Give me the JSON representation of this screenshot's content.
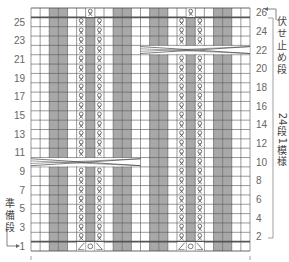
{
  "chart_data": {
    "type": "knitting-chart",
    "title": "",
    "columns": 24,
    "rows": 26,
    "colors": {
      "background": "#ffffff",
      "purl_column": "#a8a8a8",
      "grid_line": "#555555",
      "symbol": "#444444"
    },
    "column_types": [
      "k",
      "k",
      "p",
      "p",
      "k",
      "tw",
      "p",
      "tw",
      "k",
      "p",
      "p",
      "k",
      "k",
      "p",
      "p",
      "k",
      "tw",
      "p",
      "tw",
      "k",
      "p",
      "p",
      "k",
      "k"
    ],
    "left_row_labels": [
      "1",
      "3",
      "5",
      "7",
      "9",
      "11",
      "13",
      "15",
      "17",
      "19",
      "21",
      "23",
      "25"
    ],
    "right_row_labels": [
      "2",
      "4",
      "6",
      "8",
      "10",
      "12",
      "14",
      "16",
      "18",
      "20",
      "22",
      "24",
      "26"
    ],
    "special_rows": {
      "setup_row": {
        "row": 1,
        "symbols": [
          {
            "col": 5,
            "symbol": "left-decrease"
          },
          {
            "col": 6,
            "symbol": "yarn-over"
          },
          {
            "col": 7,
            "symbol": "right-decrease"
          },
          {
            "col": 16,
            "symbol": "left-decrease"
          },
          {
            "col": 17,
            "symbol": "yarn-over"
          },
          {
            "col": 18,
            "symbol": "right-decrease"
          }
        ]
      },
      "bind_off_row": {
        "row": 26,
        "symbols": [
          {
            "col": 6,
            "symbol": "twisted-knit"
          },
          {
            "col": 17,
            "symbol": "twisted-knit"
          }
        ]
      },
      "cable_crossings": [
        {
          "row": 10,
          "from_col": 0,
          "to_col": 11
        },
        {
          "row": 22,
          "from_col": 12,
          "to_col": 23
        }
      ]
    },
    "annotations": {
      "bind_off_label": "伏せ止め段",
      "repeat_label": "24段1模様",
      "setup_label": "準備段"
    }
  }
}
